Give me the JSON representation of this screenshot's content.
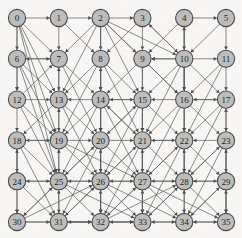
{
  "figure": {
    "type": "directed-graph",
    "width": 242,
    "height": 238,
    "background_color": "#f7f6f4"
  },
  "style": {
    "node_fill": "#bdbdbd",
    "node_stroke": "#4a4a4a",
    "node_radius": 8.6,
    "label_color": "#1c1c1c",
    "edge_color": "#5a5a5a",
    "arrow_color": "#4a4a4a"
  },
  "graph": {
    "node_count": 36,
    "grid_rows": 6,
    "grid_cols": 6,
    "origin_x": 17,
    "origin_y": 18,
    "step_x": 41.8,
    "step_y": 40.8,
    "nodes": [
      {
        "id": 0,
        "label": "0",
        "row": 0,
        "col": 0
      },
      {
        "id": 1,
        "label": "1",
        "row": 0,
        "col": 1
      },
      {
        "id": 2,
        "label": "2",
        "row": 0,
        "col": 2
      },
      {
        "id": 3,
        "label": "3",
        "row": 0,
        "col": 3
      },
      {
        "id": 4,
        "label": "4",
        "row": 0,
        "col": 4
      },
      {
        "id": 5,
        "label": "5",
        "row": 0,
        "col": 5
      },
      {
        "id": 6,
        "label": "6",
        "row": 1,
        "col": 0
      },
      {
        "id": 7,
        "label": "7",
        "row": 1,
        "col": 1
      },
      {
        "id": 8,
        "label": "8",
        "row": 1,
        "col": 2
      },
      {
        "id": 9,
        "label": "9",
        "row": 1,
        "col": 3
      },
      {
        "id": 10,
        "label": "10",
        "row": 1,
        "col": 4
      },
      {
        "id": 11,
        "label": "11",
        "row": 1,
        "col": 5
      },
      {
        "id": 12,
        "label": "12",
        "row": 2,
        "col": 0
      },
      {
        "id": 13,
        "label": "13",
        "row": 2,
        "col": 1
      },
      {
        "id": 14,
        "label": "14",
        "row": 2,
        "col": 2
      },
      {
        "id": 15,
        "label": "15",
        "row": 2,
        "col": 3
      },
      {
        "id": 16,
        "label": "16",
        "row": 2,
        "col": 4
      },
      {
        "id": 17,
        "label": "17",
        "row": 2,
        "col": 5
      },
      {
        "id": 18,
        "label": "18",
        "row": 3,
        "col": 0
      },
      {
        "id": 19,
        "label": "19",
        "row": 3,
        "col": 1
      },
      {
        "id": 20,
        "label": "20",
        "row": 3,
        "col": 2
      },
      {
        "id": 21,
        "label": "21",
        "row": 3,
        "col": 3
      },
      {
        "id": 22,
        "label": "22",
        "row": 3,
        "col": 4
      },
      {
        "id": 23,
        "label": "23",
        "row": 3,
        "col": 5
      },
      {
        "id": 24,
        "label": "24",
        "row": 4,
        "col": 0
      },
      {
        "id": 25,
        "label": "25",
        "row": 4,
        "col": 1
      },
      {
        "id": 26,
        "label": "26",
        "row": 4,
        "col": 2
      },
      {
        "id": 27,
        "label": "27",
        "row": 4,
        "col": 3
      },
      {
        "id": 28,
        "label": "28",
        "row": 4,
        "col": 4
      },
      {
        "id": 29,
        "label": "29",
        "row": 4,
        "col": 5
      },
      {
        "id": 30,
        "label": "30",
        "row": 5,
        "col": 0
      },
      {
        "id": 31,
        "label": "31",
        "row": 5,
        "col": 1
      },
      {
        "id": 32,
        "label": "32",
        "row": 5,
        "col": 2
      },
      {
        "id": 33,
        "label": "33",
        "row": 5,
        "col": 3
      },
      {
        "id": 34,
        "label": "34",
        "row": 5,
        "col": 4
      },
      {
        "id": 35,
        "label": "35",
        "row": 5,
        "col": 5
      }
    ],
    "edges": [
      [
        0,
        1
      ],
      [
        1,
        2
      ],
      [
        2,
        3
      ],
      [
        4,
        5
      ],
      [
        7,
        6
      ],
      [
        10,
        9
      ],
      [
        10,
        11
      ],
      [
        14,
        13
      ],
      [
        16,
        15
      ],
      [
        16,
        17
      ],
      [
        19,
        18
      ],
      [
        19,
        20
      ],
      [
        23,
        22
      ],
      [
        25,
        24
      ],
      [
        26,
        25
      ],
      [
        27,
        26
      ],
      [
        28,
        27
      ],
      [
        28,
        29
      ],
      [
        30,
        31
      ],
      [
        32,
        31
      ],
      [
        32,
        33
      ],
      [
        34,
        33
      ],
      [
        34,
        35
      ],
      [
        0,
        6
      ],
      [
        6,
        12
      ],
      [
        12,
        18
      ],
      [
        18,
        24
      ],
      [
        24,
        30
      ],
      [
        2,
        8
      ],
      [
        8,
        14
      ],
      [
        14,
        20
      ],
      [
        20,
        26
      ],
      [
        26,
        32
      ],
      [
        4,
        10
      ],
      [
        10,
        16
      ],
      [
        16,
        22
      ],
      [
        22,
        28
      ],
      [
        28,
        34
      ],
      [
        5,
        11
      ],
      [
        11,
        17
      ],
      [
        17,
        23
      ],
      [
        23,
        29
      ],
      [
        29,
        35
      ],
      [
        7,
        13
      ],
      [
        13,
        19
      ],
      [
        19,
        25
      ],
      [
        25,
        31
      ],
      [
        9,
        15
      ],
      [
        15,
        21
      ],
      [
        21,
        27
      ],
      [
        27,
        33
      ],
      [
        0,
        7
      ],
      [
        0,
        13
      ],
      [
        0,
        19
      ],
      [
        0,
        25
      ],
      [
        0,
        12
      ],
      [
        2,
        7
      ],
      [
        2,
        9
      ],
      [
        2,
        13
      ],
      [
        2,
        14
      ],
      [
        2,
        15
      ],
      [
        2,
        16
      ],
      [
        2,
        20
      ],
      [
        3,
        9
      ],
      [
        3,
        8
      ],
      [
        4,
        9
      ],
      [
        4,
        16
      ],
      [
        10,
        3
      ],
      [
        10,
        4
      ],
      [
        10,
        9
      ],
      [
        10,
        15
      ],
      [
        10,
        17
      ],
      [
        10,
        21
      ],
      [
        10,
        22
      ],
      [
        11,
        16
      ],
      [
        6,
        13
      ],
      [
        6,
        7
      ],
      [
        8,
        13
      ],
      [
        8,
        15
      ],
      [
        8,
        19
      ],
      [
        8,
        21
      ],
      [
        9,
        14
      ],
      [
        9,
        16
      ],
      [
        12,
        7
      ],
      [
        12,
        19
      ],
      [
        13,
        7
      ],
      [
        13,
        18
      ],
      [
        13,
        20
      ],
      [
        14,
        8
      ],
      [
        14,
        15
      ],
      [
        14,
        19
      ],
      [
        14,
        21
      ],
      [
        14,
        25
      ],
      [
        14,
        26
      ],
      [
        14,
        27
      ],
      [
        15,
        14
      ],
      [
        15,
        20
      ],
      [
        15,
        22
      ],
      [
        15,
        27
      ],
      [
        16,
        21
      ],
      [
        16,
        23
      ],
      [
        17,
        16
      ],
      [
        17,
        22
      ],
      [
        18,
        19
      ],
      [
        18,
        25
      ],
      [
        19,
        13
      ],
      [
        19,
        26
      ],
      [
        19,
        27
      ],
      [
        20,
        15
      ],
      [
        20,
        21
      ],
      [
        20,
        25
      ],
      [
        20,
        27
      ],
      [
        20,
        32
      ],
      [
        21,
        14
      ],
      [
        21,
        22
      ],
      [
        21,
        26
      ],
      [
        21,
        28
      ],
      [
        21,
        33
      ],
      [
        22,
        21
      ],
      [
        22,
        27
      ],
      [
        22,
        29
      ],
      [
        23,
        17
      ],
      [
        23,
        28
      ],
      [
        23,
        34
      ],
      [
        24,
        18
      ],
      [
        24,
        31
      ],
      [
        25,
        19
      ],
      [
        25,
        20
      ],
      [
        25,
        26
      ],
      [
        25,
        30
      ],
      [
        25,
        32
      ],
      [
        26,
        20
      ],
      [
        26,
        21
      ],
      [
        26,
        27
      ],
      [
        26,
        31
      ],
      [
        26,
        33
      ],
      [
        27,
        21
      ],
      [
        27,
        22
      ],
      [
        27,
        28
      ],
      [
        27,
        32
      ],
      [
        27,
        34
      ],
      [
        28,
        22
      ],
      [
        28,
        23
      ],
      [
        28,
        33
      ],
      [
        28,
        35
      ],
      [
        29,
        23
      ],
      [
        29,
        28
      ],
      [
        29,
        34
      ],
      [
        30,
        25
      ],
      [
        30,
        26
      ],
      [
        31,
        25
      ],
      [
        31,
        26
      ],
      [
        31,
        32
      ],
      [
        32,
        26
      ],
      [
        32,
        27
      ],
      [
        32,
        28
      ],
      [
        33,
        27
      ],
      [
        33,
        28
      ],
      [
        33,
        32
      ],
      [
        34,
        28
      ],
      [
        34,
        29
      ],
      [
        35,
        29
      ],
      [
        35,
        34
      ],
      [
        1,
        7
      ],
      [
        1,
        8
      ],
      [
        3,
        10
      ],
      [
        5,
        10
      ],
      [
        6,
        19
      ],
      [
        6,
        25
      ],
      [
        12,
        25
      ],
      [
        12,
        13
      ],
      [
        24,
        25
      ],
      [
        18,
        31
      ],
      [
        18,
        30
      ],
      [
        30,
        32
      ],
      [
        31,
        33
      ],
      [
        33,
        34
      ],
      [
        13,
        26
      ],
      [
        7,
        20
      ],
      [
        7,
        14
      ],
      [
        9,
        21
      ],
      [
        11,
        22
      ],
      [
        17,
        28
      ],
      [
        20,
        31
      ],
      [
        21,
        32
      ],
      [
        22,
        33
      ],
      [
        23,
        35
      ],
      [
        14,
        32
      ],
      [
        15,
        26
      ],
      [
        16,
        27
      ],
      [
        25,
        33
      ],
      [
        26,
        34
      ],
      [
        27,
        35
      ],
      [
        8,
        20
      ],
      [
        10,
        28
      ],
      [
        2,
        10
      ]
    ]
  }
}
